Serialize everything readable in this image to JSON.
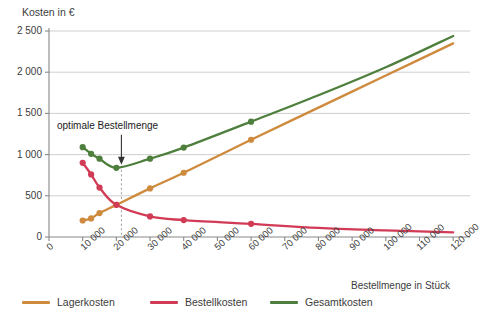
{
  "chart_data": {
    "type": "line",
    "title": "",
    "ylabel": "Kosten in €",
    "xlabel": "Bestellmenge in Stück",
    "xlim": [
      0,
      125000
    ],
    "ylim": [
      0,
      2500
    ],
    "grid": true,
    "legend_position": "bottom",
    "x_ticks": [
      0,
      10000,
      20000,
      30000,
      40000,
      50000,
      60000,
      70000,
      80000,
      90000,
      100000,
      110000,
      120000
    ],
    "x_tick_labels": [
      "0",
      "10 000",
      "20 000",
      "30 000",
      "40 000",
      "50 000",
      "60 000",
      "70 000",
      "80 000",
      "90 000",
      "100 000",
      "110 000",
      "120 000"
    ],
    "y_ticks": [
      0,
      500,
      1000,
      1500,
      2000,
      2500
    ],
    "y_tick_labels": [
      "0",
      "500",
      "1 000",
      "1 500",
      "2 000",
      "2 500"
    ],
    "annotations": [
      {
        "text": "optimale Bestellmenge",
        "x": 21500,
        "y": 840,
        "arrow": "down"
      }
    ],
    "series": [
      {
        "name": "Lagerkosten",
        "color": "#CE8A3D",
        "marker_x": [
          10000,
          12500,
          15000,
          20000,
          30000,
          40000,
          60000
        ],
        "marker_y": [
          200,
          225,
          290,
          390,
          590,
          780,
          1180
        ],
        "x": [
          10000,
          12500,
          15000,
          20000,
          30000,
          40000,
          60000,
          80000,
          100000,
          120000
        ],
        "y": [
          200,
          225,
          290,
          390,
          590,
          780,
          1180,
          1570,
          1960,
          2350
        ]
      },
      {
        "name": "Bestellkosten",
        "color": "#D23B55",
        "marker_x": [
          10000,
          12500,
          15000,
          20000,
          30000,
          40000,
          60000
        ],
        "marker_y": [
          900,
          760,
          600,
          390,
          250,
          205,
          160
        ],
        "x": [
          10000,
          12500,
          15000,
          20000,
          30000,
          40000,
          60000,
          80000,
          100000,
          120000
        ],
        "y": [
          900,
          760,
          600,
          390,
          250,
          205,
          160,
          110,
          80,
          55
        ]
      },
      {
        "name": "Gesamtkosten",
        "color": "#4E7F3C",
        "marker_x": [
          10000,
          12500,
          15000,
          20000,
          30000,
          40000,
          60000
        ],
        "marker_y": [
          1090,
          1010,
          950,
          840,
          950,
          1085,
          1400
        ],
        "x": [
          10000,
          12500,
          15000,
          20000,
          30000,
          40000,
          60000,
          80000,
          100000,
          120000
        ],
        "y": [
          1090,
          1010,
          950,
          840,
          950,
          1085,
          1400,
          1720,
          2060,
          2440
        ]
      }
    ]
  },
  "legend": {
    "items": [
      {
        "label": "Lagerkosten",
        "color": "#CE8A3D"
      },
      {
        "label": "Bestellkosten",
        "color": "#D23B55"
      },
      {
        "label": "Gesamtkosten",
        "color": "#4E7F3C"
      }
    ]
  },
  "axes": {
    "y_title": "Kosten in €",
    "x_title": "Bestellmenge in Stück"
  },
  "colors": {
    "lagerkosten": "#CE8A3D",
    "bestellkosten": "#D23B55",
    "gesamtkosten": "#4E7F3C",
    "grid": "#c9c9c9",
    "axis": "#888888",
    "text": "#3c3c3c",
    "background": "#ffffff"
  }
}
